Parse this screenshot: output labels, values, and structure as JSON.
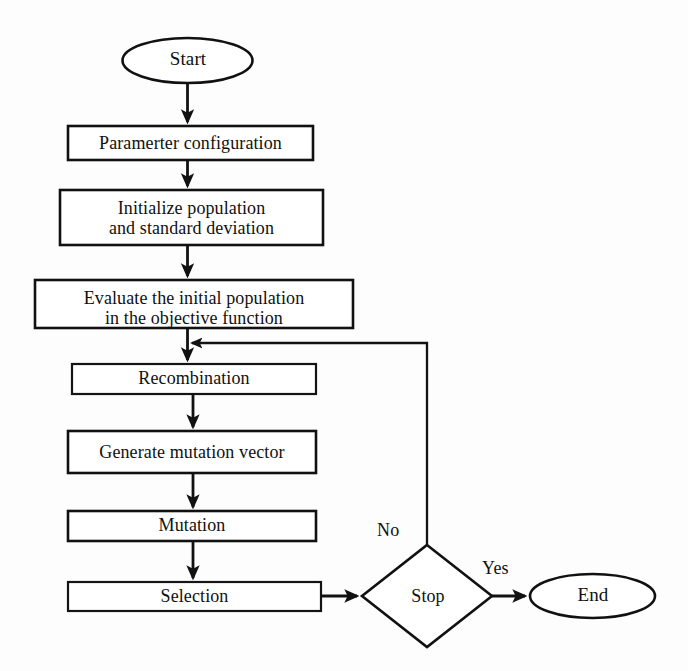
{
  "diagram": {
    "background_color": "#fdfdfd",
    "line_color": "#111111",
    "fill_color": "#ffffff",
    "nodes": [
      {
        "id": "start",
        "shape": "ellipse",
        "label": "Start"
      },
      {
        "id": "param",
        "shape": "rectangle",
        "label": "Paramerter configuration"
      },
      {
        "id": "init",
        "shape": "rectangle",
        "label": "Initialize population\nand standard deviation"
      },
      {
        "id": "eval",
        "shape": "rectangle",
        "label": "Evaluate the initial population\nin the objective function"
      },
      {
        "id": "recomb",
        "shape": "rectangle",
        "label": "Recombination"
      },
      {
        "id": "genmut",
        "shape": "rectangle",
        "label": "Generate mutation vector"
      },
      {
        "id": "mut",
        "shape": "rectangle",
        "label": "Mutation"
      },
      {
        "id": "sel",
        "shape": "rectangle",
        "label": "Selection"
      },
      {
        "id": "stop",
        "shape": "diamond",
        "label": "Stop"
      },
      {
        "id": "end",
        "shape": "ellipse",
        "label": "End"
      }
    ],
    "edges": [
      {
        "from": "start",
        "to": "param",
        "label": ""
      },
      {
        "from": "param",
        "to": "init",
        "label": ""
      },
      {
        "from": "init",
        "to": "eval",
        "label": ""
      },
      {
        "from": "eval",
        "to": "recomb",
        "label": ""
      },
      {
        "from": "recomb",
        "to": "genmut",
        "label": ""
      },
      {
        "from": "genmut",
        "to": "mut",
        "label": ""
      },
      {
        "from": "mut",
        "to": "sel",
        "label": ""
      },
      {
        "from": "sel",
        "to": "stop",
        "label": ""
      },
      {
        "from": "stop",
        "to": "recomb",
        "label": "No"
      },
      {
        "from": "stop",
        "to": "end",
        "label": "Yes"
      }
    ],
    "edge_labels": {
      "no": "No",
      "yes": "Yes"
    }
  }
}
